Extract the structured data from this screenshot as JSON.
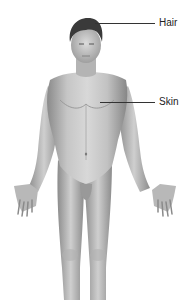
{
  "diagram": {
    "labels": [
      {
        "id": "hair",
        "text": "Hair"
      },
      {
        "id": "skin",
        "text": "Skin"
      }
    ]
  },
  "colors": {
    "background": "#ffffff",
    "skin_light": "#d4d4d4",
    "skin_mid": "#a8a8a8",
    "skin_dark": "#7a7a7a",
    "hair": "#3a3a3a",
    "leader_line": "#333333"
  }
}
